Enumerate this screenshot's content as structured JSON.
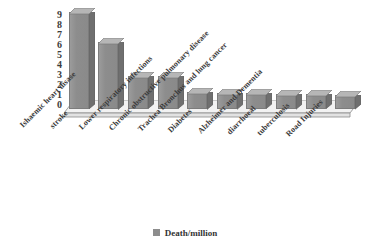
{
  "chart_data": {
    "type": "bar",
    "title": "",
    "subtitle": "",
    "xlabel": "",
    "ylabel": "",
    "ylim": [
      0,
      9
    ],
    "yticks": [
      9,
      8,
      7,
      6,
      5,
      4,
      3,
      2,
      1,
      0
    ],
    "grid": false,
    "legend_position": "bottom",
    "style": "3d-column",
    "categories": [
      "Ishaemic heart disase",
      "stroke",
      "Lower respiratory infections",
      "Chronic obstructive pulmonary disease",
      "Trachea Bronchus and lung cancer",
      "Diabetes",
      "Alzheimer and Dementia",
      "diarrhoeal",
      "tuberculosis",
      "Road Injuries"
    ],
    "series": [
      {
        "name": "Death/million",
        "values": [
          8.9,
          6.2,
          3.0,
          3.0,
          1.6,
          1.5,
          1.45,
          1.4,
          1.35,
          1.3
        ]
      }
    ]
  },
  "legend": {
    "entries": [
      {
        "label": "Death/million",
        "color": "#8d8d8d"
      }
    ]
  },
  "colors": {
    "bar_face": "#8d8d8d",
    "bar_top": "#b4b4b4",
    "bar_side": "#6f6f6f",
    "floor": "#f0f0f0",
    "axis_line": "#8a8a8a",
    "text": "#3a3a3a"
  }
}
